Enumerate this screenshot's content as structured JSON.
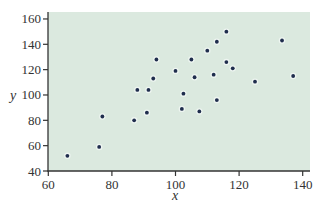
{
  "chart_data": {
    "type": "scatter",
    "title": "",
    "xlabel": "x",
    "ylabel": "y",
    "xlim": [
      60,
      142
    ],
    "ylim": [
      40,
      165
    ],
    "x_ticks": [
      60,
      80,
      100,
      120,
      140
    ],
    "y_ticks": [
      40,
      60,
      80,
      100,
      120,
      140,
      160
    ],
    "x_tick_labels": [
      "60",
      "80",
      "100",
      "120",
      "140"
    ],
    "y_tick_labels": [
      "40",
      "60",
      "80",
      "100",
      "120",
      "140",
      "160"
    ],
    "grid": false,
    "legend": null,
    "series": [
      {
        "name": "data",
        "points": [
          {
            "x": 66,
            "y": 52
          },
          {
            "x": 76,
            "y": 59
          },
          {
            "x": 77,
            "y": 83
          },
          {
            "x": 87,
            "y": 80
          },
          {
            "x": 88,
            "y": 104
          },
          {
            "x": 91,
            "y": 86
          },
          {
            "x": 91.5,
            "y": 104
          },
          {
            "x": 93,
            "y": 113
          },
          {
            "x": 94,
            "y": 128
          },
          {
            "x": 100,
            "y": 119
          },
          {
            "x": 102,
            "y": 89
          },
          {
            "x": 102.5,
            "y": 101
          },
          {
            "x": 105,
            "y": 128
          },
          {
            "x": 106,
            "y": 114
          },
          {
            "x": 107.5,
            "y": 87
          },
          {
            "x": 110,
            "y": 135
          },
          {
            "x": 112,
            "y": 116
          },
          {
            "x": 113,
            "y": 142
          },
          {
            "x": 113,
            "y": 96
          },
          {
            "x": 116,
            "y": 150
          },
          {
            "x": 116,
            "y": 126
          },
          {
            "x": 118,
            "y": 121
          },
          {
            "x": 125,
            "y": 110.5
          },
          {
            "x": 133.5,
            "y": 143
          },
          {
            "x": 137,
            "y": 115
          }
        ]
      }
    ]
  },
  "colors": {
    "plot_background": "#dbe9df",
    "point": "#1f2d4d",
    "axis": "#333333",
    "text": "#333333"
  }
}
